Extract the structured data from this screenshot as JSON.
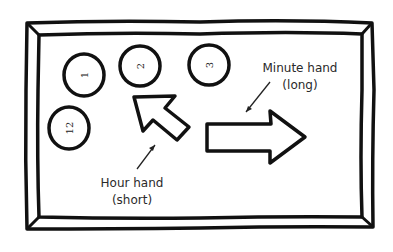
{
  "diagram": {
    "colors": {
      "ink": "#111111",
      "paper": "#ffffff",
      "label": "#2a2a2a"
    },
    "number_circles": [
      {
        "label": "1",
        "orientation": "rotated-left"
      },
      {
        "label": "2",
        "orientation": "rotated-left"
      },
      {
        "label": "3",
        "orientation": "rotated-left"
      },
      {
        "label": "12",
        "orientation": "rotated-left"
      }
    ],
    "hands": {
      "hour": {
        "name": "Hour hand",
        "note": "(short)",
        "direction": "up-left"
      },
      "minute": {
        "name": "Minute hand",
        "note": "(long)",
        "direction": "right"
      }
    }
  }
}
